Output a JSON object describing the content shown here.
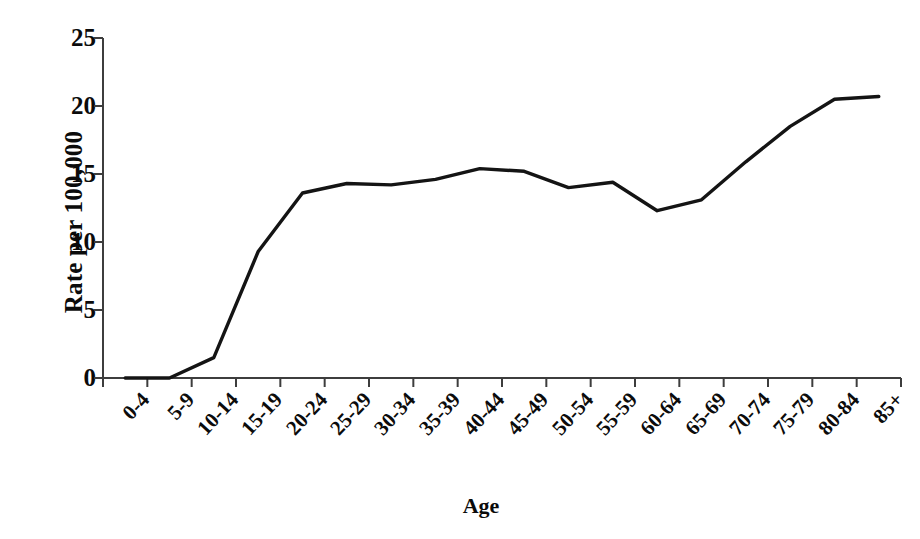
{
  "chart_data": {
    "type": "line",
    "title": "",
    "xlabel": "Age",
    "ylabel": "Rate per 100,000",
    "categories": [
      "0-4",
      "5-9",
      "10-14",
      "15-19",
      "20-24",
      "25-29",
      "30-34",
      "35-39",
      "40-44",
      "45-49",
      "50-54",
      "55-59",
      "60-64",
      "65-69",
      "70-74",
      "75-79",
      "80-84",
      "85+"
    ],
    "values": [
      0,
      0,
      1.5,
      9.3,
      13.6,
      14.3,
      14.2,
      14.6,
      15.4,
      15.2,
      14.0,
      14.4,
      12.3,
      13.1,
      15.9,
      18.5,
      20.5,
      20.7
    ],
    "series": [
      {
        "name": "Rate",
        "values": [
          0,
          0,
          1.5,
          9.3,
          13.6,
          14.3,
          14.2,
          14.6,
          15.4,
          15.2,
          14.0,
          14.4,
          12.3,
          13.1,
          15.9,
          18.5,
          20.5,
          20.7
        ]
      }
    ],
    "ylim": [
      0,
      25
    ],
    "y_ticks": [
      0,
      5,
      10,
      15,
      20,
      25
    ],
    "grid": false,
    "legend": false,
    "legend_position": "none",
    "line_color": "#141414",
    "background_color": "#ffffff",
    "axis_color": "#3d3d3d",
    "markers": false
  },
  "axes": {
    "y_title": "Rate per 100,000",
    "x_title": "Age"
  }
}
